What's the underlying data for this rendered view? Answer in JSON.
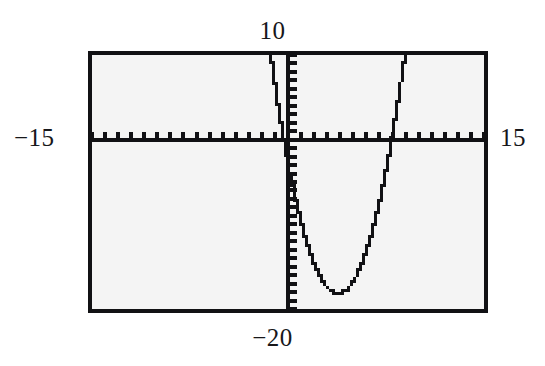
{
  "window": {
    "title": "graphing-calculator-viewport"
  },
  "labels": {
    "ymax": "10",
    "ymin": "−20",
    "xmin": "−15",
    "xmax": "15"
  },
  "colors": {
    "screen_background": "#f4f4f4",
    "frame": "#111114",
    "ink": "#17171a",
    "curve": "#111114"
  },
  "chart_data": {
    "type": "line",
    "title": "",
    "xlabel": "",
    "ylabel": "",
    "xlim": [
      -15,
      15
    ],
    "ylim": [
      -20,
      10
    ],
    "grid": false,
    "legend": null,
    "axis_ticks": {
      "x_tick_interval": 1,
      "y_tick_interval": 1,
      "tick_style": "hash-marks-on-axes"
    },
    "annotations": [
      {
        "text": "10",
        "position": "top",
        "meaning": "y-axis maximum (Ymax)"
      },
      {
        "text": "−20",
        "position": "bottom",
        "meaning": "y-axis minimum (Ymin)"
      },
      {
        "text": "−15",
        "position": "left",
        "meaning": "x-axis minimum (Xmin)"
      },
      {
        "text": "15",
        "position": "right",
        "meaning": "x-axis maximum (Xmax)"
      }
    ],
    "series": [
      {
        "name": "parabola",
        "kind": "quadratic",
        "vertex": [
          3.7,
          -18.0
        ],
        "roots": [
          -0.4,
          7.8
        ],
        "leading_coefficient": 1.07,
        "x": [
          -0.9,
          -0.5,
          0.0,
          0.5,
          1.0,
          1.5,
          2.0,
          2.5,
          3.0,
          3.5,
          3.7,
          4.0,
          4.5,
          5.0,
          5.5,
          6.0,
          6.5,
          7.0,
          7.5,
          8.0,
          8.5,
          8.8
        ],
        "values": [
          10.0,
          3.7,
          -3.4,
          -9.0,
          -13.1,
          -15.7,
          -16.9,
          -17.6,
          -17.5,
          -18.0,
          -18.0,
          -17.9,
          -17.3,
          -16.2,
          -14.6,
          -12.5,
          -9.9,
          -6.7,
          -3.1,
          1.1,
          5.7,
          8.8
        ]
      }
    ]
  },
  "plot_geometry": {
    "screen_left_px": 88,
    "screen_top_px": 51,
    "screen_width_px": 400,
    "screen_height_px": 262,
    "origin_x_px": 290,
    "origin_y_px": 140
  }
}
